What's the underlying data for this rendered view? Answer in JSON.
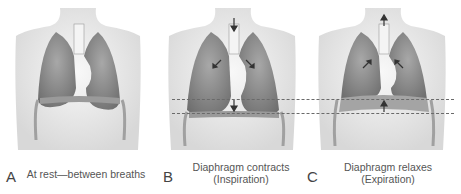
{
  "panels": [
    {
      "letter": "A",
      "caption_line1": "At rest—between breaths",
      "caption_line2": ""
    },
    {
      "letter": "B",
      "caption_line1": "Diaphragm contracts",
      "caption_line2": "(Inspiration)"
    },
    {
      "letter": "C",
      "caption_line1": "Diaphragm relaxes",
      "caption_line2": "(Expiration)"
    }
  ],
  "colors": {
    "lung": "#8d8d8d",
    "torso": "#ececec",
    "trachea": "#f4f4f4",
    "dash": "#6a6a6a"
  }
}
